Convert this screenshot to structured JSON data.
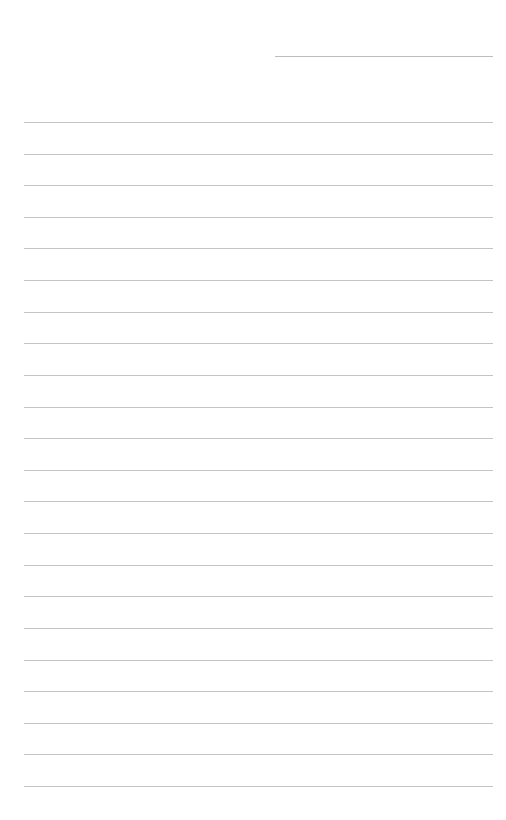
{
  "page": {
    "type": "lined-paper",
    "background_color": "#ffffff",
    "line_color": "#c4c4c4"
  },
  "header_line": {
    "label": "",
    "value": ""
  },
  "lines": [
    {
      "text": ""
    },
    {
      "text": ""
    },
    {
      "text": ""
    },
    {
      "text": ""
    },
    {
      "text": ""
    },
    {
      "text": ""
    },
    {
      "text": ""
    },
    {
      "text": ""
    },
    {
      "text": ""
    },
    {
      "text": ""
    },
    {
      "text": ""
    },
    {
      "text": ""
    },
    {
      "text": ""
    },
    {
      "text": ""
    },
    {
      "text": ""
    },
    {
      "text": ""
    },
    {
      "text": ""
    },
    {
      "text": ""
    },
    {
      "text": ""
    },
    {
      "text": ""
    },
    {
      "text": ""
    },
    {
      "text": ""
    }
  ]
}
